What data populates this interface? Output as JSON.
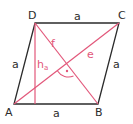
{
  "diagram": {
    "type": "rhombus",
    "vertices": {
      "A": "A",
      "B": "B",
      "C": "C",
      "D": "D"
    },
    "sides": {
      "top": "a",
      "left": "a",
      "right": "a",
      "bottom": "a"
    },
    "diagonals": {
      "e": "e",
      "f": "f"
    },
    "height": {
      "label": "h",
      "subscript": "a"
    },
    "right_angle_marker": "·",
    "colors": {
      "outline": "#2b2b2b",
      "construction": "#e2577a"
    }
  }
}
